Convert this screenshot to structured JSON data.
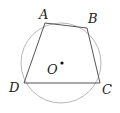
{
  "diagram": {
    "type": "inscribed-quadrilateral",
    "circle": {
      "cx": 61,
      "cy": 63,
      "r": 40,
      "stroke": "#b8b8b8"
    },
    "polygon": {
      "points": "45,23 87,28 100,83 24,83",
      "stroke": "#555555"
    },
    "center": {
      "x": 62,
      "y": 63
    },
    "labels": {
      "A": "A",
      "B": "B",
      "C": "C",
      "D": "D",
      "O": "O"
    }
  }
}
